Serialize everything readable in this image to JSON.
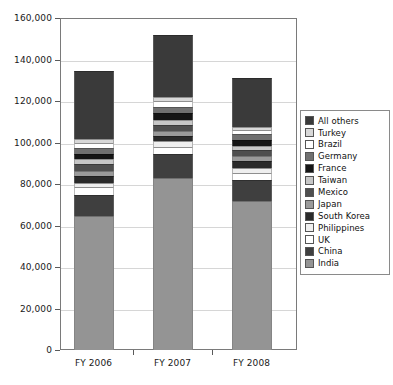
{
  "chart_data": {
    "type": "bar",
    "variant": "stacked-vertical",
    "title": "",
    "subtitle": "",
    "xlabel": "",
    "ylabel": "",
    "categories": [
      "FY 2006",
      "FY 2007",
      "FY 2008"
    ],
    "ylim": [
      0,
      160000
    ],
    "ytick_values": [
      0,
      20000,
      40000,
      60000,
      80000,
      100000,
      120000,
      140000,
      160000
    ],
    "ytick_labels": [
      "0",
      "20,000",
      "40,000",
      "60,000",
      "80,000",
      "100,000",
      "120,000",
      "140,000",
      "160,000"
    ],
    "grid": true,
    "grid_axis": "y",
    "legend_position": "right",
    "legend_order_top_to_bottom": [
      "All others",
      "Turkey",
      "Brazil",
      "Germany",
      "France",
      "Taiwan",
      "Mexico",
      "Japan",
      "South Korea",
      "Philippines",
      "UK",
      "China",
      "India"
    ],
    "stack_order_bottom_to_top": [
      "India",
      "China",
      "UK",
      "Philippines",
      "South Korea",
      "Japan",
      "Mexico",
      "Taiwan",
      "France",
      "Germany",
      "Brazil",
      "Turkey",
      "All others"
    ],
    "series": [
      {
        "name": "India",
        "color": "#949494",
        "values": [
          64500,
          83000,
          72000
        ]
      },
      {
        "name": "China",
        "color": "#3f3f3f",
        "values": [
          10000,
          11500,
          10000
        ]
      },
      {
        "name": "UK",
        "color": "#ffffff",
        "values": [
          4000,
          3500,
          3500
        ]
      },
      {
        "name": "Philippines",
        "color": "#efefef",
        "values": [
          2000,
          2500,
          2000
        ]
      },
      {
        "name": "South Korea",
        "color": "#2a2a2a",
        "values": [
          3500,
          2500,
          3500
        ]
      },
      {
        "name": "Japan",
        "color": "#9a9a9a",
        "values": [
          2500,
          2500,
          2500
        ]
      },
      {
        "name": "Mexico",
        "color": "#4f4f4f",
        "values": [
          3000,
          3000,
          3000
        ]
      },
      {
        "name": "Taiwan",
        "color": "#c7c7c7",
        "values": [
          2500,
          2500,
          2000
        ]
      },
      {
        "name": "France",
        "color": "#151515",
        "values": [
          2500,
          3000,
          2500
        ]
      },
      {
        "name": "Germany",
        "color": "#707070",
        "values": [
          3000,
          3000,
          3000
        ]
      },
      {
        "name": "Brazil",
        "color": "#ffffff",
        "values": [
          2500,
          3000,
          2000
        ]
      },
      {
        "name": "Turkey",
        "color": "#d8d8d8",
        "values": [
          1500,
          2000,
          1500
        ]
      },
      {
        "name": "All others",
        "color": "#3a3a3a",
        "values": [
          33000,
          30000,
          23500
        ]
      }
    ],
    "totals": [
      134500,
      153000,
      129000
    ]
  },
  "legend": {
    "items": [
      {
        "label": "All others",
        "color": "#3a3a3a"
      },
      {
        "label": "Turkey",
        "color": "#d8d8d8"
      },
      {
        "label": "Brazil",
        "color": "#ffffff"
      },
      {
        "label": "Germany",
        "color": "#707070"
      },
      {
        "label": "France",
        "color": "#151515"
      },
      {
        "label": "Taiwan",
        "color": "#c7c7c7"
      },
      {
        "label": "Mexico",
        "color": "#4f4f4f"
      },
      {
        "label": "Japan",
        "color": "#9a9a9a"
      },
      {
        "label": "South Korea",
        "color": "#2a2a2a"
      },
      {
        "label": "Philippines",
        "color": "#efefef"
      },
      {
        "label": "UK",
        "color": "#ffffff"
      },
      {
        "label": "China",
        "color": "#3f3f3f"
      },
      {
        "label": "India",
        "color": "#949494"
      }
    ]
  }
}
